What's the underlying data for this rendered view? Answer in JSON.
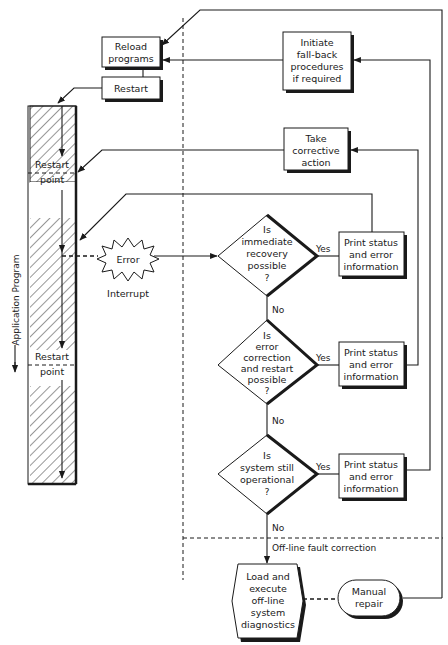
{
  "diagram": {
    "side_label": "Application Program",
    "boxes": {
      "reload": [
        "Reload",
        "programs"
      ],
      "restart": "Restart",
      "initiate": [
        "Initiate",
        "fall-back",
        "procedures",
        "if required"
      ],
      "take_corrective": [
        "Take",
        "corrective",
        "action"
      ],
      "print1": [
        "Print status",
        "and error",
        "information"
      ],
      "print2": [
        "Print status",
        "and error",
        "information"
      ],
      "print3": [
        "Print status",
        "and error",
        "information"
      ]
    },
    "program_bar": {
      "restart_point_1": [
        "Restart",
        "point"
      ],
      "restart_point_2": [
        "Restart",
        "point"
      ]
    },
    "error": {
      "label": "Error",
      "caption": "Interrupt"
    },
    "decisions": [
      {
        "lines": [
          "Is",
          "immediate",
          "recovery",
          "possible",
          "?"
        ],
        "yes": "Yes",
        "no": "No"
      },
      {
        "lines": [
          "Is",
          "error",
          "correction",
          "and restart",
          "possible",
          "?"
        ],
        "yes": "Yes",
        "no": "No"
      },
      {
        "lines": [
          "Is",
          "system still",
          "operational",
          "?"
        ],
        "yes": "Yes",
        "no": "No"
      }
    ],
    "offline_label": "Off-line fault correction",
    "diagnostics": [
      "Load and",
      "execute",
      "off-line",
      "system",
      "diagnostics"
    ],
    "manual_repair": [
      "Manual",
      "repair"
    ]
  }
}
